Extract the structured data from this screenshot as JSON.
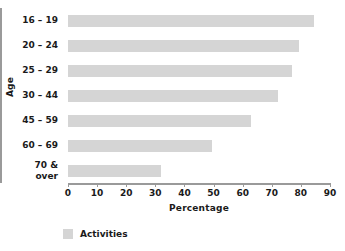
{
  "chart_data": {
    "type": "bar",
    "orientation": "horizontal",
    "title": "",
    "xlabel": "Percentage",
    "ylabel": "Age",
    "categories": [
      "16 – 19",
      "20 – 24",
      "25 – 29",
      "30 – 44",
      "45 – 59",
      "60 – 69",
      "70 &\nover"
    ],
    "values": [
      84.5,
      79.5,
      77,
      72,
      63,
      49.5,
      32
    ],
    "series": [
      {
        "name": "Activities",
        "values": [
          84.5,
          79.5,
          77,
          72,
          63,
          49.5,
          32
        ]
      }
    ],
    "xlim": [
      0,
      90
    ],
    "xticks": [
      0,
      10,
      20,
      30,
      40,
      50,
      60,
      70,
      80,
      90
    ],
    "xtick_labels": [
      "0",
      "10",
      "20",
      "30",
      "40",
      "50",
      "60",
      "70",
      "80",
      "90"
    ],
    "grid": false,
    "legend": {
      "position": "bottom-left",
      "entries": [
        {
          "label": "Activities",
          "color": "#d5d5d5"
        }
      ]
    },
    "colors": {
      "bar": "#d5d5d5",
      "axis": "#9a9a9a",
      "text": "#1a1a1a",
      "background": "#ffffff"
    }
  }
}
